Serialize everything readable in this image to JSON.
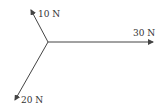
{
  "diagram": {
    "type": "force-diagram",
    "origin": [
      48,
      42
    ],
    "forces": [
      {
        "label": "10 N",
        "magnitude": 10,
        "unit": "N",
        "tip": [
          31,
          10
        ],
        "label_pos": [
          38,
          17
        ]
      },
      {
        "label": "30 N",
        "magnitude": 30,
        "unit": "N",
        "tip": [
          153,
          42
        ],
        "label_pos": [
          133,
          36
        ]
      },
      {
        "label": "20 N",
        "magnitude": 20,
        "unit": "N",
        "tip": [
          15,
          100
        ],
        "label_pos": [
          21,
          103
        ]
      }
    ],
    "line_color": "#444444"
  }
}
